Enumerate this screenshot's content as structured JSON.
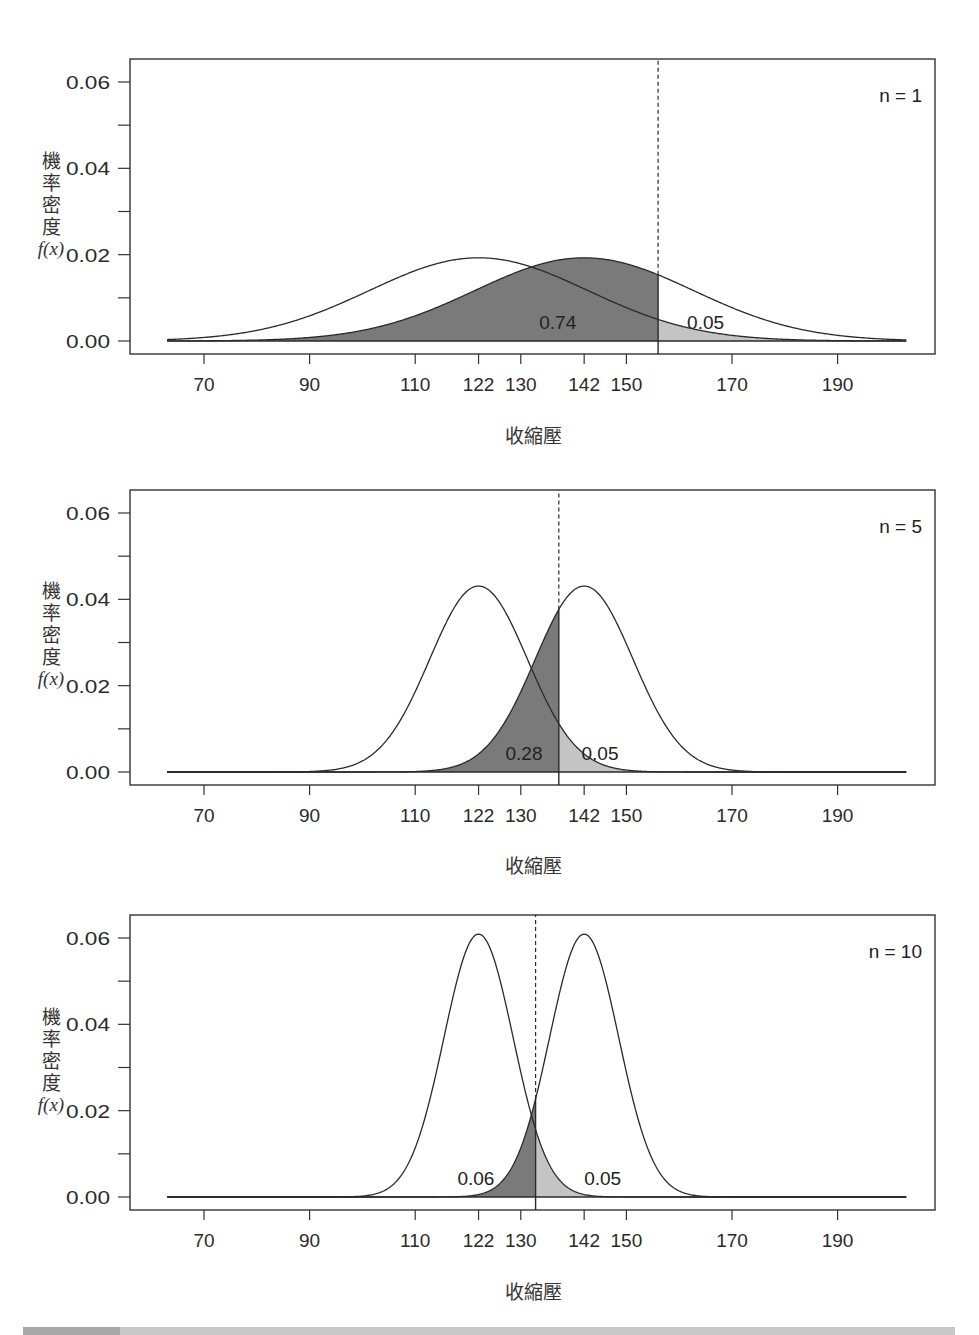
{
  "figure": {
    "ylabel_chars": [
      "機",
      "率",
      "密",
      "度"
    ],
    "ylabel_fx": "f(x)",
    "xlabel": "收縮壓",
    "colors": {
      "power_fill": "#7a7a7a",
      "alpha_fill": "#c4c4c4",
      "line": "#2a2a2a",
      "axis": "#333333"
    }
  },
  "chart_data": [
    {
      "type": "area",
      "title": "n = 1",
      "n": 1,
      "xlabel": "收縮壓",
      "ylabel": "機率密度 f(x)",
      "x_ticks": [
        70,
        90,
        110,
        122,
        130,
        142,
        150,
        170,
        190
      ],
      "y_ticks": [
        0.0,
        0.02,
        0.04,
        0.06
      ],
      "y_tick_labels": [
        "0.00",
        "0.02",
        "0.04",
        "0.06"
      ],
      "ylim": [
        0,
        0.06
      ],
      "xrange_curve": [
        63,
        203
      ],
      "series": [
        {
          "name": "H0 distribution",
          "mean": 122,
          "sd": 20.7
        },
        {
          "name": "H1 distribution",
          "mean": 142,
          "sd": 20.7
        }
      ],
      "critical_value": 156.0,
      "annotations": [
        {
          "label": "0.74",
          "x": 137,
          "y": 0.0032,
          "meaning": "power region (shaded dark)"
        },
        {
          "label": "0.05",
          "x": 165,
          "y": 0.0032,
          "meaning": "alpha region (shaded light)"
        }
      ],
      "grid": false
    },
    {
      "type": "area",
      "title": "n = 5",
      "n": 5,
      "xlabel": "收縮壓",
      "ylabel": "機率密度 f(x)",
      "x_ticks": [
        70,
        90,
        110,
        122,
        130,
        142,
        150,
        170,
        190
      ],
      "y_ticks": [
        0.0,
        0.02,
        0.04,
        0.06
      ],
      "y_tick_labels": [
        "0.00",
        "0.02",
        "0.04",
        "0.06"
      ],
      "ylim": [
        0,
        0.06
      ],
      "xrange_curve": [
        63,
        203
      ],
      "series": [
        {
          "name": "H0 distribution",
          "mean": 122,
          "sd": 9.26
        },
        {
          "name": "H1 distribution",
          "mean": 142,
          "sd": 9.26
        }
      ],
      "critical_value": 137.2,
      "annotations": [
        {
          "label": "0.28",
          "x": 130.6,
          "y": 0.0032,
          "meaning": "power region (shaded dark)"
        },
        {
          "label": "0.05",
          "x": 145,
          "y": 0.0032,
          "meaning": "alpha region (shaded light)"
        }
      ],
      "grid": false
    },
    {
      "type": "area",
      "title": "n = 10",
      "n": 10,
      "xlabel": "收縮壓",
      "ylabel": "機率密度 f(x)",
      "x_ticks": [
        70,
        90,
        110,
        122,
        130,
        142,
        150,
        170,
        190
      ],
      "y_ticks": [
        0.0,
        0.02,
        0.04,
        0.06
      ],
      "y_tick_labels": [
        "0.00",
        "0.02",
        "0.04",
        "0.06"
      ],
      "ylim": [
        0,
        0.06
      ],
      "xrange_curve": [
        63,
        203
      ],
      "series": [
        {
          "name": "H0 distribution",
          "mean": 122,
          "sd": 6.55
        },
        {
          "name": "H1 distribution",
          "mean": 142,
          "sd": 6.55
        }
      ],
      "critical_value": 132.8,
      "annotations": [
        {
          "label": "0.06",
          "x": 121.5,
          "y": 0.0032,
          "meaning": "power region (shaded dark)"
        },
        {
          "label": "0.05",
          "x": 145.5,
          "y": 0.0032,
          "meaning": "alpha region (shaded light)"
        }
      ],
      "grid": false
    }
  ]
}
